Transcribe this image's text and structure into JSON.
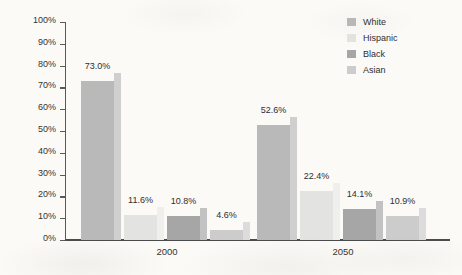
{
  "chart_data": {
    "type": "bar",
    "title": "",
    "subtitle": "",
    "xlabel": "",
    "ylabel": "Percentage of U.S. Workforce",
    "categories": [
      "2000",
      "2050"
    ],
    "ylim": [
      0,
      100
    ],
    "ytick_labels": [
      "100%",
      "90%",
      "80%",
      "70%",
      "60%",
      "50%",
      "40%",
      "30%",
      "20%",
      "10%",
      "0%"
    ],
    "ytick_values": [
      100,
      90,
      80,
      70,
      60,
      50,
      40,
      30,
      20,
      10,
      0
    ],
    "grid": false,
    "legend_position": "top-right",
    "series": [
      {
        "name": "White",
        "color": "#b9b9b9",
        "side_color": "#cfcfcf",
        "values": [
          73.0,
          52.6
        ],
        "labels": [
          "73.0%",
          "52.6%"
        ]
      },
      {
        "name": "Hispanic",
        "color": "#e3e3e1",
        "side_color": "#efefee",
        "values": [
          11.6,
          22.4
        ],
        "labels": [
          "11.6%",
          "22.4%"
        ]
      },
      {
        "name": "Black",
        "color": "#a6a6a6",
        "side_color": "#c2c2c2",
        "values": [
          10.8,
          14.1
        ],
        "labels": [
          "10.8%",
          "14.1%"
        ]
      },
      {
        "name": "Asian",
        "color": "#cccccc",
        "side_color": "#dcdcdc",
        "values": [
          4.6,
          10.9
        ],
        "labels": [
          "4.6%",
          "10.9%"
        ]
      }
    ]
  },
  "legend": {
    "items": [
      {
        "label": "White"
      },
      {
        "label": "Hispanic"
      },
      {
        "label": "Black"
      },
      {
        "label": "Asian"
      }
    ]
  },
  "axes": {
    "y_title": "Percentage of U.S. Workforce"
  },
  "colors": {
    "background": "#fbfaf7",
    "axis": "#4a4a4a",
    "text": "#2e2e2e"
  }
}
